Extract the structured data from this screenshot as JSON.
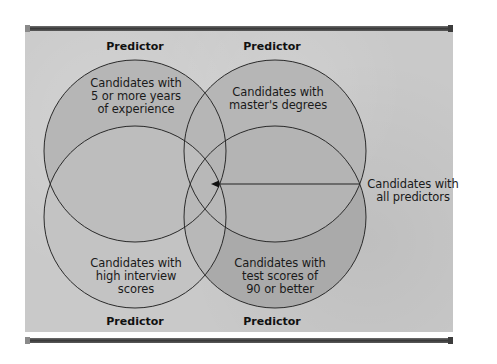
{
  "diagram": {
    "type": "venn",
    "title": "",
    "predictor_label": "Predictor",
    "predictor_headers": {
      "top_left": "Predictor",
      "top_right": "Predictor",
      "bottom_left": "Predictor",
      "bottom_right": "Predictor"
    },
    "sets": [
      {
        "id": "experience",
        "position": "top-left",
        "lines": [
          "Candidates with",
          "5 or more years",
          "of experience"
        ],
        "fill": "#b3b3b3"
      },
      {
        "id": "masters",
        "position": "top-right",
        "lines": [
          "Candidates with",
          "master's degrees"
        ],
        "fill": "#b3b3b3"
      },
      {
        "id": "interview",
        "position": "bottom-left",
        "lines": [
          "Candidates with",
          "high interview",
          "scores"
        ],
        "fill": "#c2c2c2"
      },
      {
        "id": "test_scores",
        "position": "bottom-right",
        "lines": [
          "Candidates with",
          "test scores of",
          "90 or better"
        ],
        "fill": "#a8a8a8"
      }
    ],
    "callout": {
      "lines": [
        "Candidates with",
        "all predictors"
      ],
      "points_to": "intersection of all four sets"
    },
    "colors": {
      "background": "#c9c9c9",
      "outline": "#2a2a2a",
      "frame_bar": "#3a3a3a"
    }
  }
}
